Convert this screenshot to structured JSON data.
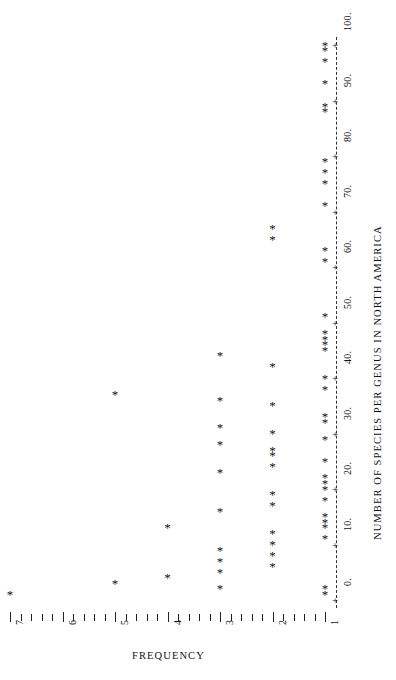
{
  "chart_data": {
    "type": "scatter",
    "title": "",
    "subtitle": "",
    "orientation": "rotated-90",
    "xlabel": "FREQUENCY",
    "ylabel": "NUMBER OF SPECIES PER GENUS IN NORTH AMERICA",
    "xlim": [
      1,
      7
    ],
    "ylim": [
      0,
      100
    ],
    "grid": false,
    "legend": null,
    "x_tick_labels": [
      "1",
      "2",
      "3",
      "4",
      "5",
      "6",
      "7"
    ],
    "x_tick_values": [
      1,
      2,
      3,
      4,
      5,
      6,
      7
    ],
    "x_minor_ticks_per_major": 5,
    "y_tick_labels": [
      "0.",
      "10.",
      "20.",
      "30.",
      "40.",
      "50.",
      "60.",
      "70.",
      "80.",
      "90.",
      "100."
    ],
    "y_tick_values": [
      0,
      10,
      20,
      30,
      40,
      50,
      60,
      70,
      80,
      90,
      100
    ],
    "y_axis_style": "dashed-spine-with-plus-marks",
    "marker": "*",
    "marker_color": "#111111",
    "x_key": "frequency",
    "y_key": "species_per_genus",
    "points": [
      {
        "species_per_genus": 1,
        "frequency": 7
      },
      {
        "species_per_genus": 3,
        "frequency": 5
      },
      {
        "species_per_genus": 4,
        "frequency": 4
      },
      {
        "species_per_genus": 2,
        "frequency": 3
      },
      {
        "species_per_genus": 5,
        "frequency": 3
      },
      {
        "species_per_genus": 7,
        "frequency": 3
      },
      {
        "species_per_genus": 9,
        "frequency": 3
      },
      {
        "species_per_genus": 6,
        "frequency": 2
      },
      {
        "species_per_genus": 8,
        "frequency": 2
      },
      {
        "species_per_genus": 10,
        "frequency": 2
      },
      {
        "species_per_genus": 12,
        "frequency": 2
      },
      {
        "species_per_genus": 1,
        "frequency": 1
      },
      {
        "species_per_genus": 2,
        "frequency": 1
      },
      {
        "species_per_genus": 11,
        "frequency": 1
      },
      {
        "species_per_genus": 13,
        "frequency": 1
      },
      {
        "species_per_genus": 14,
        "frequency": 1
      },
      {
        "species_per_genus": 15,
        "frequency": 1
      },
      {
        "species_per_genus": 18,
        "frequency": 1
      },
      {
        "species_per_genus": 20,
        "frequency": 1
      },
      {
        "species_per_genus": 21,
        "frequency": 1
      },
      {
        "species_per_genus": 22,
        "frequency": 1
      },
      {
        "species_per_genus": 25,
        "frequency": 1
      },
      {
        "species_per_genus": 29,
        "frequency": 1
      },
      {
        "species_per_genus": 32,
        "frequency": 1
      },
      {
        "species_per_genus": 33,
        "frequency": 1
      },
      {
        "species_per_genus": 38,
        "frequency": 1
      },
      {
        "species_per_genus": 40,
        "frequency": 1
      },
      {
        "species_per_genus": 45,
        "frequency": 1
      },
      {
        "species_per_genus": 46,
        "frequency": 1
      },
      {
        "species_per_genus": 47,
        "frequency": 1
      },
      {
        "species_per_genus": 48,
        "frequency": 1
      },
      {
        "species_per_genus": 51,
        "frequency": 1
      },
      {
        "species_per_genus": 61,
        "frequency": 1
      },
      {
        "species_per_genus": 63,
        "frequency": 1
      },
      {
        "species_per_genus": 71,
        "frequency": 1
      },
      {
        "species_per_genus": 75,
        "frequency": 1
      },
      {
        "species_per_genus": 77,
        "frequency": 1
      },
      {
        "species_per_genus": 79,
        "frequency": 1
      },
      {
        "species_per_genus": 88,
        "frequency": 1
      },
      {
        "species_per_genus": 89,
        "frequency": 1
      },
      {
        "species_per_genus": 93,
        "frequency": 1
      },
      {
        "species_per_genus": 97,
        "frequency": 1
      },
      {
        "species_per_genus": 99,
        "frequency": 1
      },
      {
        "species_per_genus": 100,
        "frequency": 1
      },
      {
        "species_per_genus": 17,
        "frequency": 2
      },
      {
        "species_per_genus": 19,
        "frequency": 2
      },
      {
        "species_per_genus": 24,
        "frequency": 2
      },
      {
        "species_per_genus": 26,
        "frequency": 2
      },
      {
        "species_per_genus": 27,
        "frequency": 2
      },
      {
        "species_per_genus": 30,
        "frequency": 2
      },
      {
        "species_per_genus": 35,
        "frequency": 2
      },
      {
        "species_per_genus": 42,
        "frequency": 2
      },
      {
        "species_per_genus": 65,
        "frequency": 2
      },
      {
        "species_per_genus": 67,
        "frequency": 2
      },
      {
        "species_per_genus": 16,
        "frequency": 3
      },
      {
        "species_per_genus": 23,
        "frequency": 3
      },
      {
        "species_per_genus": 28,
        "frequency": 3
      },
      {
        "species_per_genus": 31,
        "frequency": 3
      },
      {
        "species_per_genus": 36,
        "frequency": 3
      },
      {
        "species_per_genus": 44,
        "frequency": 3
      },
      {
        "species_per_genus": 37,
        "frequency": 5
      },
      {
        "species_per_genus": 13,
        "frequency": 4
      }
    ]
  },
  "axes": {
    "frequency": {
      "title": "FREQUENCY",
      "ticks": [
        {
          "value": 7,
          "label": "7"
        },
        {
          "value": 6,
          "label": "6"
        },
        {
          "value": 5,
          "label": "5"
        },
        {
          "value": 4,
          "label": "4"
        },
        {
          "value": 3,
          "label": "3"
        },
        {
          "value": 2,
          "label": "2"
        },
        {
          "value": 1,
          "label": "1"
        }
      ]
    },
    "species": {
      "title": "NUMBER OF SPECIES PER GENUS IN NORTH AMERICA",
      "ticks": [
        {
          "value": 0,
          "label": "0."
        },
        {
          "value": 10,
          "label": "10."
        },
        {
          "value": 20,
          "label": "20."
        },
        {
          "value": 30,
          "label": "30."
        },
        {
          "value": 40,
          "label": "40."
        },
        {
          "value": 50,
          "label": "50."
        },
        {
          "value": 60,
          "label": "60."
        },
        {
          "value": 70,
          "label": "70."
        },
        {
          "value": 80,
          "label": "80."
        },
        {
          "value": 90,
          "label": "90."
        },
        {
          "value": 100,
          "label": "100."
        }
      ],
      "plus_mark": "+"
    }
  }
}
